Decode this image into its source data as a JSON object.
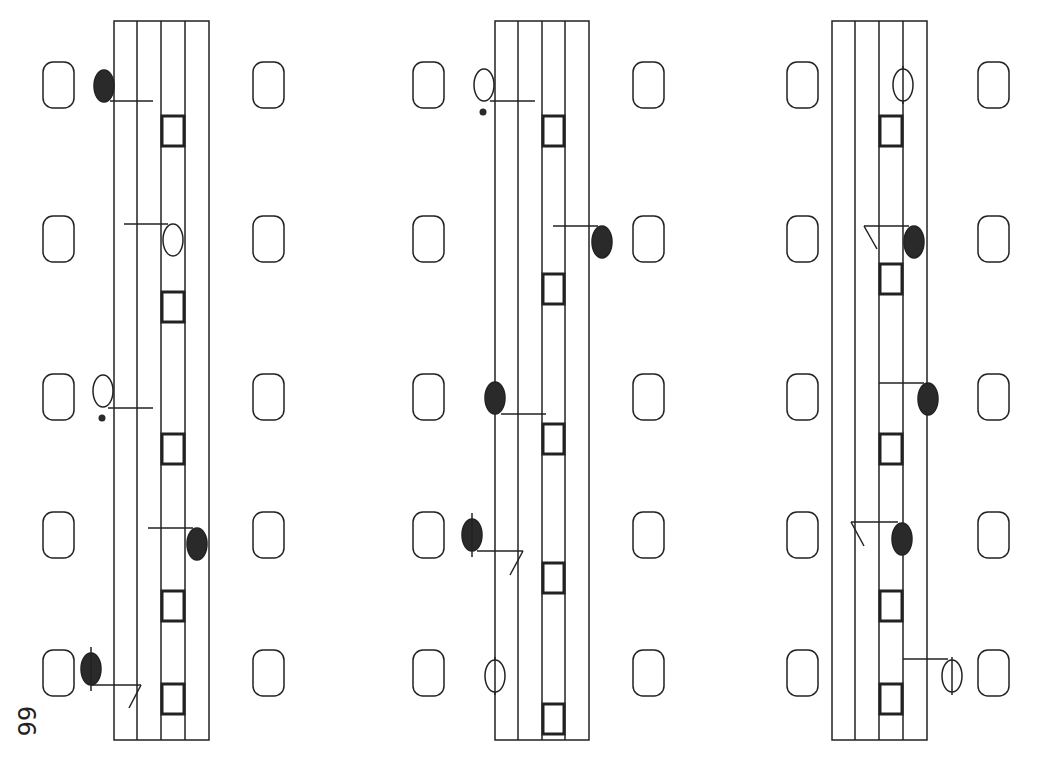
{
  "page": {
    "number": "66",
    "colors": {
      "ink": "#222222",
      "background": "#ffffff",
      "fill": "#2a2a2a"
    }
  },
  "diagram": {
    "type": "vertical-tablature-sequence",
    "staff_count": 3,
    "staffs": [
      {
        "id": 1,
        "lines_x": [
          114,
          137,
          161,
          185,
          209
        ],
        "top": 21,
        "bottom": 740,
        "side_boxes": {
          "left_x": 43,
          "right_x": 253
        },
        "rests": [
          116,
          292,
          434,
          591,
          684
        ],
        "notes": [
          {
            "cx": 104,
            "cy": 86,
            "fill": "filled",
            "stem": [
              [
                110,
                101
              ],
              [
                153,
                101
              ]
            ],
            "dot": false
          },
          {
            "cx": 173,
            "cy": 240,
            "fill": "open",
            "stem": [
              [
                124,
                224
              ],
              [
                168,
                224
              ]
            ],
            "dot": false
          },
          {
            "cx": 103,
            "cy": 391,
            "fill": "open",
            "stem": [
              [
                108,
                408
              ],
              [
                153,
                408
              ]
            ],
            "dot": true
          },
          {
            "cx": 197,
            "cy": 544,
            "fill": "filled",
            "stem": [
              [
                148,
                528
              ],
              [
                193,
                528
              ]
            ],
            "dot": false
          },
          {
            "cx": 91,
            "cy": 669,
            "fill": "filled",
            "stem": [
              [
                92,
                685
              ],
              [
                141,
                685
              ]
            ],
            "dot": false,
            "tick": true,
            "flag": [
              [
                141,
                685
              ],
              [
                129,
                708
              ]
            ]
          }
        ]
      },
      {
        "id": 2,
        "lines_x": [
          495,
          518,
          542,
          565,
          589
        ],
        "top": 21,
        "bottom": 740,
        "side_boxes": {
          "left_x": 413,
          "right_x": 633
        },
        "rests": [
          116,
          274,
          424,
          563,
          704
        ],
        "notes": [
          {
            "cx": 484,
            "cy": 85,
            "fill": "open",
            "stem": [
              [
                490,
                101
              ],
              [
                535,
                101
              ]
            ],
            "dot": true
          },
          {
            "cx": 602,
            "cy": 242,
            "fill": "filled",
            "stem": [
              [
                553,
                226
              ],
              [
                598,
                226
              ]
            ],
            "dot": false
          },
          {
            "cx": 495,
            "cy": 398,
            "fill": "filled",
            "stem": [
              [
                501,
                414
              ],
              [
                546,
                414
              ]
            ],
            "dot": false
          },
          {
            "cx": 472,
            "cy": 535,
            "fill": "filled",
            "stem": [
              [
                477,
                551
              ],
              [
                523,
                551
              ]
            ],
            "dot": false,
            "tick": true,
            "flag": [
              [
                523,
                551
              ],
              [
                510,
                575
              ]
            ]
          },
          {
            "cx": 495,
            "cy": 676,
            "fill": "open",
            "stem": null,
            "dot": false,
            "line_through": true
          }
        ]
      },
      {
        "id": 3,
        "lines_x": [
          832,
          855,
          879,
          903,
          927
        ],
        "top": 21,
        "bottom": 740,
        "side_boxes": {
          "left_x": 787,
          "right_x": 978
        },
        "rests": [
          116,
          264,
          434,
          591,
          684
        ],
        "notes": [
          {
            "cx": 903,
            "cy": 85,
            "fill": "open",
            "stem": null,
            "dot": false,
            "line_through": true
          },
          {
            "cx": 914,
            "cy": 242,
            "fill": "filled",
            "stem": [
              [
                864,
                226
              ],
              [
                909,
                226
              ]
            ],
            "dot": false,
            "flag": [
              [
                864,
                226
              ],
              [
                877,
                249
              ]
            ]
          },
          {
            "cx": 928,
            "cy": 399,
            "fill": "filled",
            "stem": [
              [
                879,
                383
              ],
              [
                924,
                383
              ]
            ],
            "dot": false
          },
          {
            "cx": 902,
            "cy": 539,
            "fill": "filled",
            "stem": [
              [
                851,
                522
              ],
              [
                898,
                522
              ]
            ],
            "dot": false,
            "flag": [
              [
                851,
                522
              ],
              [
                864,
                546
              ]
            ]
          },
          {
            "cx": 952,
            "cy": 676,
            "fill": "open",
            "stem": [
              [
                903,
                659
              ],
              [
                948,
                659
              ]
            ],
            "dot": false,
            "line_through": true
          }
        ]
      }
    ],
    "box_rows_y": [
      62,
      216,
      374,
      512,
      650
    ],
    "box_size": {
      "w": 31,
      "h": 46,
      "r": 10
    }
  }
}
